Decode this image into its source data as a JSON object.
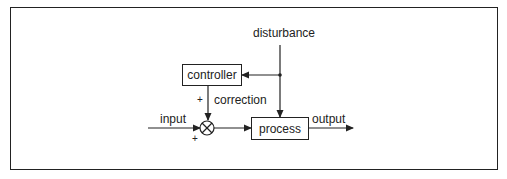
{
  "diagram": {
    "type": "feedforward control block diagram",
    "nodes": {
      "controller": {
        "label": "controller"
      },
      "process": {
        "label": "process"
      },
      "summing_junction": {
        "symbol": "⊗"
      }
    },
    "signals": {
      "disturbance": "disturbance",
      "correction": "correction",
      "input": "input",
      "output": "output"
    },
    "signs": {
      "correction_sign": "+",
      "input_sign": "+"
    },
    "edges": [
      {
        "from": "disturbance",
        "to": "junction-dot"
      },
      {
        "from": "junction-dot",
        "to": "controller"
      },
      {
        "from": "junction-dot",
        "to": "process"
      },
      {
        "from": "controller",
        "to": "summing_junction",
        "label": "correction",
        "sign": "+"
      },
      {
        "from": "input",
        "to": "summing_junction",
        "sign": "+"
      },
      {
        "from": "summing_junction",
        "to": "process"
      },
      {
        "from": "process",
        "to": "output"
      }
    ],
    "colors": {
      "stroke": "#222222",
      "background": "#ffffff"
    }
  }
}
